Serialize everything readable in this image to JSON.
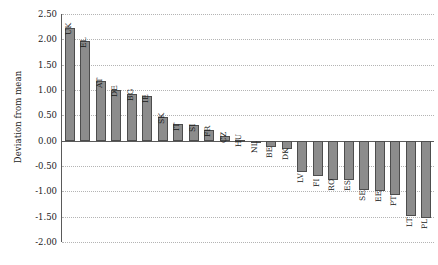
{
  "chart_data": {
    "type": "bar",
    "title": "",
    "subtitle": "",
    "xlabel": "",
    "ylabel": "Deviation from mean",
    "ylim": [
      -2.0,
      2.5
    ],
    "ytick_step": 0.5,
    "ytick_labels": [
      "2.50",
      "2.00",
      "1.50",
      "1.00",
      "0.50",
      "0.00",
      "-0.50",
      "-1.00",
      "-1.50",
      "-2.00"
    ],
    "ytick_values": [
      2.5,
      2.0,
      1.5,
      1.0,
      0.5,
      0.0,
      -0.5,
      -1.0,
      -1.5,
      -2.0
    ],
    "grid": true,
    "grid_axis": "y",
    "grid_style": "dotted",
    "legend": false,
    "legend_position": "none",
    "xtick_labels_rotated": true,
    "bar_color": "#8c8c8c",
    "bar_edge_color": "#4d4d4d",
    "axis_color": "#5a5a5a",
    "grid_color": "#b4b4b4",
    "categories": [
      "UK",
      "EL",
      "AT",
      "DE",
      "BG",
      "IE",
      "SK",
      "IT",
      "SI",
      "FR",
      "CZ",
      "HU",
      "NL",
      "BE",
      "DK",
      "LV",
      "FI",
      "RO",
      "ES",
      "SE",
      "EE",
      "PT",
      "LT",
      "PL"
    ],
    "values": [
      2.22,
      1.97,
      1.17,
      1.0,
      0.92,
      0.89,
      0.47,
      0.32,
      0.3,
      0.22,
      0.1,
      0.01,
      -0.03,
      -0.13,
      -0.17,
      -0.62,
      -0.7,
      -0.77,
      -0.77,
      -0.97,
      -1.0,
      -1.08,
      -1.48,
      -1.53
    ]
  }
}
